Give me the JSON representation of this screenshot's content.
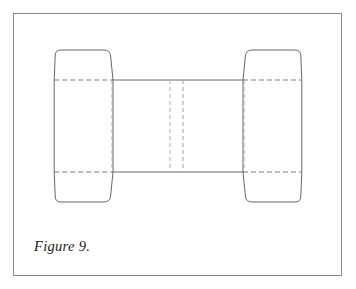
{
  "figure": {
    "caption": "Figure 9.",
    "border_color": "#8a8a8a",
    "background_color": "#ffffff",
    "cut_line_color": "#555555",
    "fold_line_color": "#999999"
  },
  "diagram": {
    "type": "packaging-dieline",
    "frame": {
      "x": 13,
      "y": 13,
      "width": 329,
      "height": 263
    },
    "panels": [
      {
        "name": "left-end-flap",
        "x_left": 54,
        "x_right": 110,
        "y_top": 50,
        "y_bottom": 202,
        "corner_radius": 7
      },
      {
        "name": "center-panel",
        "x_left": 110,
        "x_right": 246,
        "y_top": 80,
        "y_bottom": 172
      },
      {
        "name": "right-end-flap",
        "x_left": 246,
        "x_right": 303,
        "y_top": 50,
        "y_bottom": 202,
        "corner_radius": 7
      }
    ],
    "horizontal_fold_lines": [
      {
        "name": "top-fold",
        "y": 80,
        "x_start": 54,
        "x_end": 303
      },
      {
        "name": "bottom-fold",
        "y": 172,
        "x_start": 54,
        "x_end": 303
      }
    ],
    "vertical_fold_lines": [
      {
        "name": "left-panel-fold",
        "x": 110,
        "y_start": 80,
        "y_end": 172
      },
      {
        "name": "center-fold-left",
        "x": 170,
        "y_start": 80,
        "y_end": 172
      },
      {
        "name": "center-fold-right",
        "x": 183,
        "y_start": 80,
        "y_end": 172
      },
      {
        "name": "right-panel-fold",
        "x": 246,
        "y_start": 80,
        "y_end": 172
      }
    ]
  }
}
